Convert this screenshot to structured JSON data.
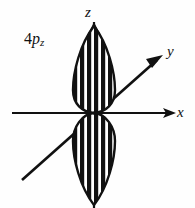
{
  "figure": {
    "background_color": "#fefefe",
    "ink_color": "#111111",
    "width": 195,
    "height": 208
  },
  "orbital": {
    "label_number": "4",
    "label_symbol": "p",
    "label_subscript": "z",
    "type": "p-orbital",
    "orientation": "z",
    "lobe_count": 2,
    "fill_pattern": "vertical-stripes",
    "stripe_color_dark": "#111111",
    "stripe_color_light": "#ffffff",
    "radial_node_stripes": 6,
    "outline_color": "#111111"
  },
  "axes": {
    "x": {
      "label": "x",
      "direction": "horizontal-right",
      "arrowhead": true
    },
    "y": {
      "label": "y",
      "direction": "diagonal-up-right",
      "arrowhead": true
    },
    "z": {
      "label": "z",
      "direction": "vertical-up",
      "arrowhead": true
    }
  },
  "geometry": {
    "origin_x": 94,
    "origin_y": 113,
    "lobe_half_width": 21,
    "upper_lobe_tip_y": 26,
    "lower_lobe_tip_y": 205
  }
}
